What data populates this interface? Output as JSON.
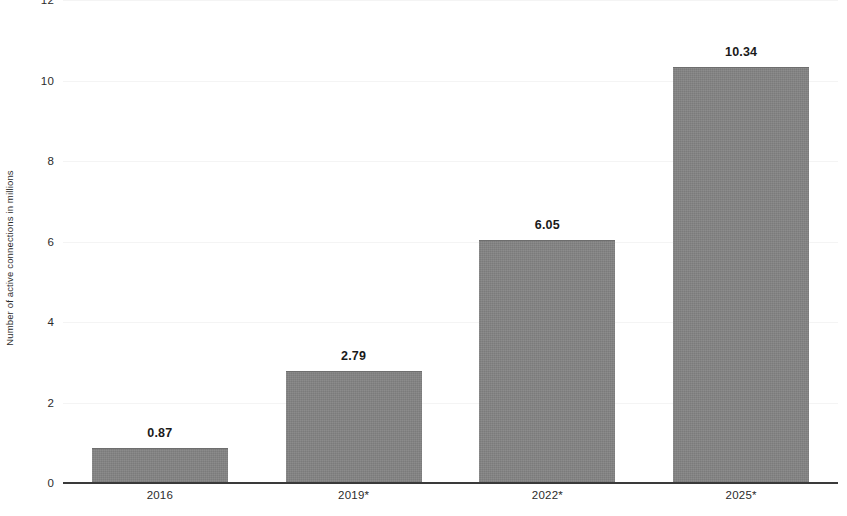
{
  "chart_data": {
    "type": "bar",
    "title": "",
    "subtitle": "",
    "xlabel": "",
    "ylabel": "Number of active connections in millions",
    "categories": [
      "2016",
      "2019*",
      "2022*",
      "2025*"
    ],
    "values": [
      0.87,
      2.79,
      6.05,
      10.34
    ],
    "value_labels": [
      "0.87",
      "2.79",
      "6.05",
      "10.34"
    ],
    "series": [
      {
        "name": "Number of active connections in millions",
        "values": [
          0.87,
          2.79,
          6.05,
          10.34
        ]
      }
    ],
    "ylim": [
      0,
      12
    ],
    "y_ticks": [
      0,
      2,
      4,
      6,
      8,
      10,
      12
    ],
    "y_tick_labels": [
      "0",
      "2",
      "4",
      "6",
      "8",
      "10",
      "12"
    ],
    "grid": true,
    "grid_axis": "y",
    "legend": false,
    "legend_position": "none",
    "bar_color": "#848484",
    "value_label_color": "#1a1a1a",
    "axis_color": "#3a3a3a",
    "gridline_color": "#f4f4f4",
    "background_color": "#ffffff",
    "annotations": [
      "* denotes forecast or projected year"
    ]
  }
}
